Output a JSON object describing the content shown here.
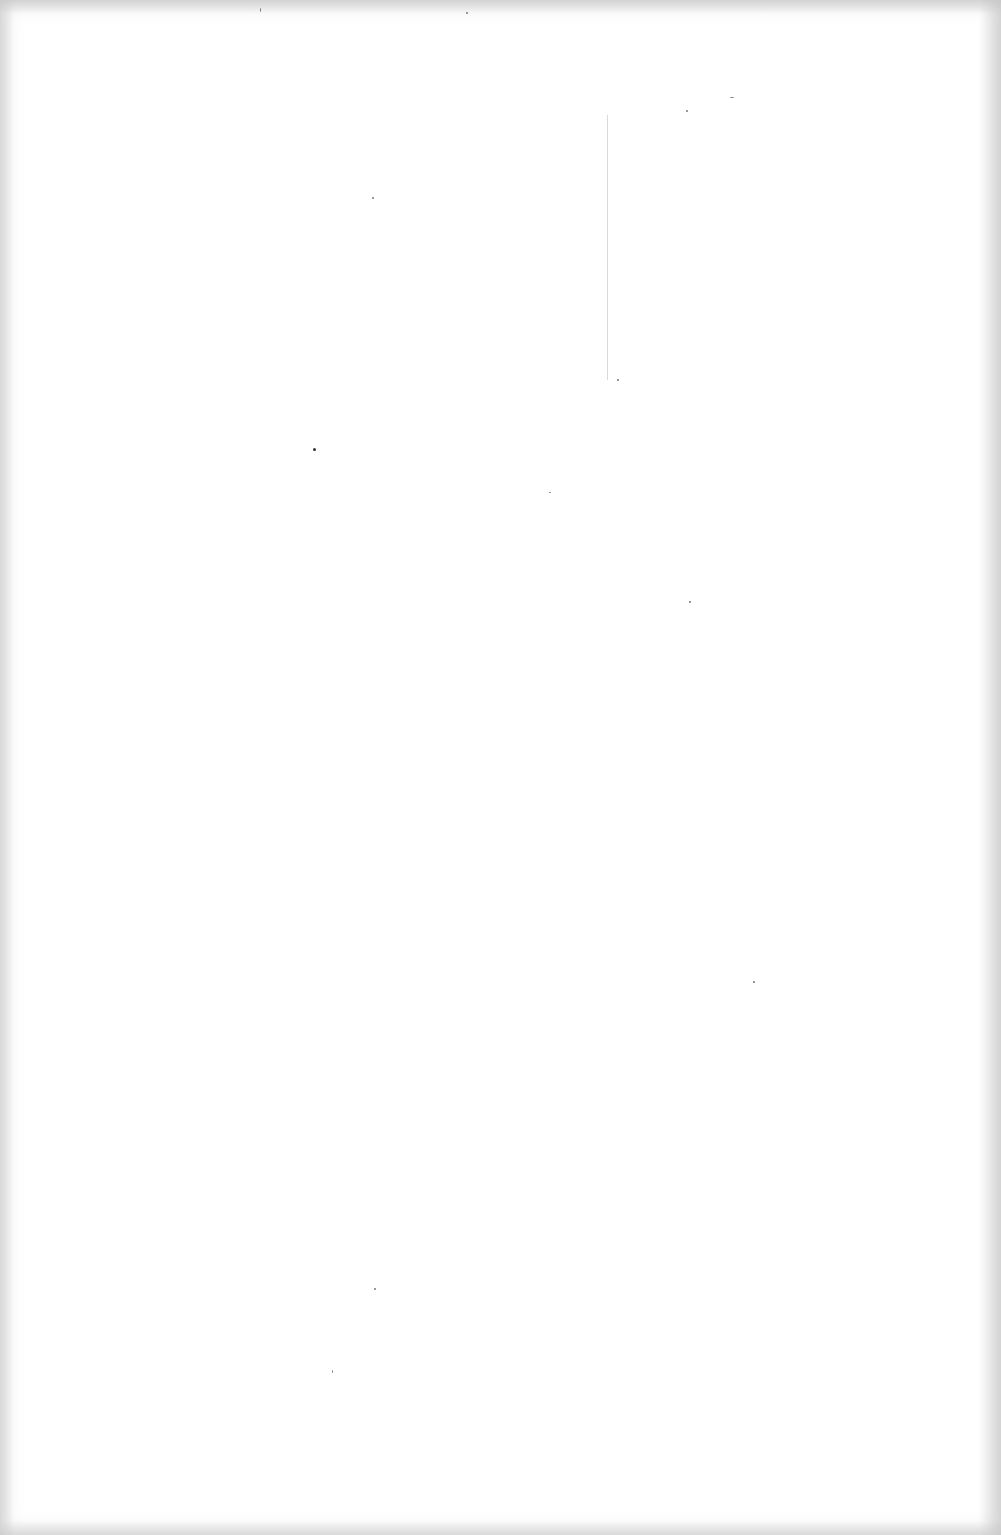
{
  "document": {
    "type": "blank-scanned-page",
    "text": ""
  },
  "colors": {
    "paper": "#ffffff",
    "edge_shadow": "#c8c8c8",
    "line": "#aaaaaa",
    "speck": "#777777"
  }
}
